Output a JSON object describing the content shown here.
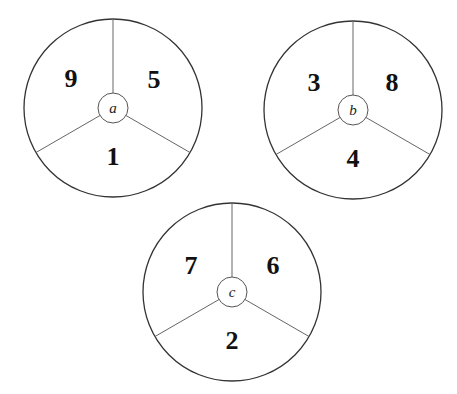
{
  "spinners": [
    {
      "label": "a",
      "cx": 113,
      "cy": 108,
      "segments": {
        "upper_left": "9",
        "upper_right": "5",
        "bottom": "1"
      }
    },
    {
      "label": "b",
      "cx": 353,
      "cy": 110,
      "segments": {
        "upper_left": "3",
        "upper_right": "8",
        "bottom": "4"
      }
    },
    {
      "label": "c",
      "cx": 232,
      "cy": 292,
      "segments": {
        "upper_left": "7",
        "upper_right": "6",
        "bottom": "2"
      }
    }
  ]
}
